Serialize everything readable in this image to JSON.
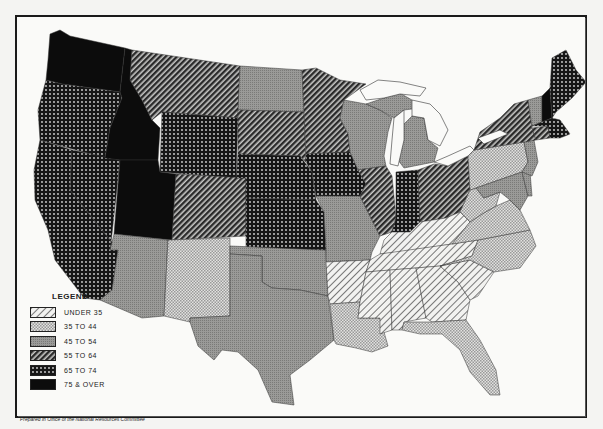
{
  "legend": {
    "title": "LEGEND",
    "items": [
      {
        "label": "UNDER  35",
        "pattern": "hatch-light"
      },
      {
        "label": "35  TO  44",
        "pattern": "check"
      },
      {
        "label": "45  TO  54",
        "pattern": "gray"
      },
      {
        "label": "55  TO  64",
        "pattern": "hatch-dark"
      },
      {
        "label": "65  TO  74",
        "pattern": "dots"
      },
      {
        "label": "75  &  OVER",
        "pattern": "black"
      }
    ]
  },
  "footer": {
    "credit": "Prepared in Office of the National Resources Committee"
  },
  "states": {
    "WA": "black",
    "ID": "black",
    "UT": "black",
    "NH": "black",
    "OR": "dots",
    "CA": "dots",
    "NV": "dots",
    "WY": "dots",
    "NE": "dots",
    "KS": "dots",
    "IA": "dots",
    "IN": "dots",
    "ME": "dots",
    "MA": "dots",
    "MT": "hatch-dark",
    "CO": "hatch-dark",
    "SD": "hatch-dark",
    "MN": "hatch-dark",
    "IL": "hatch-dark",
    "OH": "hatch-dark",
    "NY": "hatch-dark",
    "CT": "hatch-dark",
    "ND": "gray",
    "WI": "gray",
    "MI": "gray",
    "MO": "gray",
    "OK": "gray",
    "TX": "gray",
    "AZ": "gray",
    "VT": "gray",
    "NJ": "gray",
    "MD": "gray",
    "DE": "gray",
    "NM": "check",
    "PA": "check",
    "WV": "check",
    "VA": "check",
    "NC": "check",
    "LA": "check",
    "FL": "check",
    "KY": "hatch-light",
    "TN": "hatch-light",
    "AR": "hatch-light",
    "MS": "hatch-light",
    "AL": "hatch-light",
    "GA": "hatch-light",
    "SC": "hatch-light"
  }
}
